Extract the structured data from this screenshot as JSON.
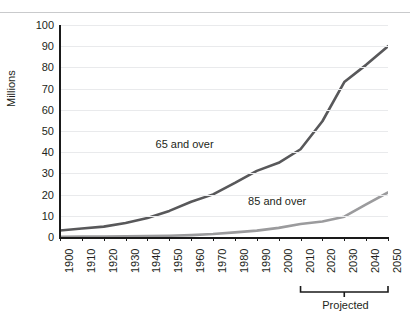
{
  "top_cutoff_fragments": [
    "........",
    "..",
    "..",
    ". ."
  ],
  "chart_data": {
    "type": "line",
    "title": "",
    "xlabel": "",
    "ylabel": "Millions",
    "xlim": [
      1900,
      2050
    ],
    "ylim": [
      0,
      100
    ],
    "yticks": [
      100,
      90,
      80,
      70,
      60,
      50,
      40,
      30,
      20,
      10,
      0
    ],
    "xticks": [
      "1900",
      "1910",
      "1920",
      "1930",
      "1940",
      "1950",
      "1960",
      "1970",
      "1980",
      "1990",
      "2000",
      "2010",
      "2020",
      "2030",
      "2040",
      "2050"
    ],
    "grid": "horizontal",
    "legend": "inline-annotations",
    "x": [
      1900,
      1910,
      1920,
      1930,
      1940,
      1950,
      1960,
      1970,
      1980,
      1990,
      2000,
      2010,
      2020,
      2030,
      2040,
      2050
    ],
    "series": [
      {
        "name": "65 and over",
        "color": "#58585a",
        "values": [
          3.1,
          4.0,
          4.9,
          6.6,
          9.0,
          12.3,
          16.6,
          20.1,
          25.5,
          31.2,
          35.0,
          41.4,
          54.6,
          73.1,
          81.2,
          90.0
        ]
      },
      {
        "name": "85 and over",
        "color": "#9b9b9d",
        "values": [
          0.1,
          0.2,
          0.2,
          0.3,
          0.4,
          0.6,
          0.9,
          1.4,
          2.2,
          3.0,
          4.3,
          6.1,
          7.3,
          9.6,
          15.4,
          21.0
        ]
      }
    ],
    "annotations": [
      {
        "name": "series-label-65",
        "text": "65 and over",
        "x_frac": 0.395,
        "y_value": 44
      },
      {
        "name": "series-label-85",
        "text": "85 and over",
        "x_frac": 0.665,
        "y_value": 17
      },
      {
        "name": "projected-bracket-label",
        "text": "Projected",
        "range": [
          "2010",
          "2050"
        ]
      }
    ],
    "bracket": {
      "label": "Projected",
      "from": "2010",
      "to": "2050"
    }
  }
}
